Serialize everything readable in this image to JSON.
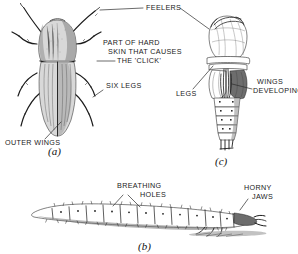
{
  "figure": {
    "background_color": "#ffffff",
    "ink_color": "#1b1b1b",
    "width": 298,
    "height": 254
  },
  "labels": {
    "feelers": "FEELERS",
    "part_of_hard_line1": "PART OF HARD",
    "part_of_hard_line2": "SKIN THAT CAUSES",
    "part_of_hard_line3": "THE 'CLICK'",
    "six_legs": "SIX LEGS",
    "outer_wings": "OUTER WINGS",
    "legs": "LEGS",
    "wings_developing_line1": "WINGS",
    "wings_developing_line2": "DEVELOPING",
    "breathing_holes_line1": "BREATHING",
    "breathing_holes_line2": "HOLES",
    "horny_jaws_line1": "HORNY",
    "horny_jaws_line2": "JAWS"
  },
  "figure_letters": {
    "a": "(a)",
    "b": "(b)",
    "c": "(c)"
  },
  "specimens": {
    "a": {
      "name": "adult-click-beetle",
      "letter": "(a)"
    },
    "b": {
      "name": "wireworm-larva",
      "letter": "(b)"
    },
    "c": {
      "name": "pupa",
      "letter": "(c)"
    }
  }
}
